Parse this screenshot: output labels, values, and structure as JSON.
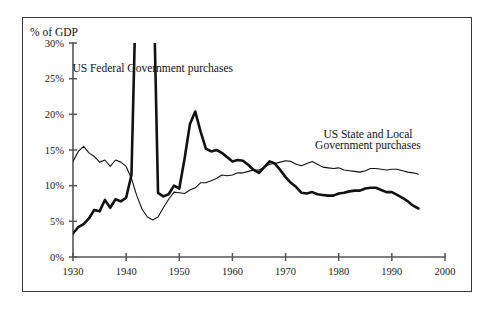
{
  "figure": {
    "y_axis_title": "% of GDP",
    "frame_color": "#3a3a3a",
    "background": "#ffffff"
  },
  "annotations": [
    {
      "name": "federal-series-label",
      "text": "US Federal Government purchases",
      "x": 1945.0,
      "y": 26.0
    },
    {
      "name": "state-local-series-label-line1",
      "text": "US State and Local",
      "x": 1985.5,
      "y": 16.7
    },
    {
      "name": "state-local-series-label-line2",
      "text": "Government purchases",
      "x": 1985.5,
      "y": 15.1
    }
  ],
  "chart_data": {
    "type": "line",
    "title": "",
    "xlabel": "",
    "ylabel": "% of GDP",
    "xlim": [
      1930,
      2000
    ],
    "ylim": [
      0,
      30
    ],
    "grid": false,
    "legend": "inline-annotations",
    "xticks": [
      1930,
      1940,
      1950,
      1960,
      1970,
      1980,
      1990,
      2000
    ],
    "xtick_labels": [
      "1930",
      "1940",
      "1950",
      "1960",
      "1970",
      "1980",
      "1990",
      "2000"
    ],
    "yticks": [
      0,
      5,
      10,
      15,
      20,
      25,
      30
    ],
    "ytick_labels": [
      "0%",
      "5%",
      "10%",
      "15%",
      "20%",
      "25%",
      "30%"
    ],
    "note": "Federal series is clipped at the 30% top of the plot during WWII (1942-1945).",
    "series": [
      {
        "name": "US Federal Government purchases",
        "style": "thick",
        "color": "#111111",
        "x": [
          1930,
          1931,
          1932,
          1933,
          1934,
          1935,
          1936,
          1937,
          1938,
          1939,
          1940,
          1941,
          1941.6,
          1942,
          1943,
          1944,
          1945,
          1945.4,
          1946,
          1947,
          1948,
          1949,
          1950,
          1951,
          1952,
          1953,
          1954,
          1955,
          1956,
          1957,
          1958,
          1959,
          1960,
          1961,
          1962,
          1963,
          1964,
          1965,
          1966,
          1967,
          1968,
          1969,
          1970,
          1971,
          1972,
          1973,
          1974,
          1975,
          1976,
          1977,
          1978,
          1979,
          1980,
          1981,
          1982,
          1983,
          1984,
          1985,
          1986,
          1987,
          1988,
          1989,
          1990,
          1991,
          1992,
          1993,
          1994,
          1995
        ],
        "y": [
          3.3,
          4.2,
          4.6,
          5.4,
          6.6,
          6.4,
          8.0,
          6.9,
          8.1,
          7.8,
          8.3,
          11.5,
          30.0,
          41.0,
          44.0,
          43.0,
          38.0,
          30.0,
          9.0,
          8.5,
          8.8,
          10.0,
          9.6,
          13.8,
          18.6,
          20.4,
          17.6,
          15.2,
          14.8,
          15.0,
          14.6,
          14.0,
          13.4,
          13.6,
          13.5,
          12.9,
          12.2,
          11.8,
          12.6,
          13.4,
          13.1,
          12.2,
          11.2,
          10.4,
          9.8,
          9.0,
          8.9,
          9.1,
          8.8,
          8.7,
          8.6,
          8.6,
          8.9,
          9.0,
          9.2,
          9.3,
          9.3,
          9.6,
          9.7,
          9.7,
          9.4,
          9.1,
          9.1,
          8.7,
          8.3,
          7.8,
          7.2,
          6.8
        ]
      },
      {
        "name": "US State and Local Government purchases",
        "style": "thin",
        "color": "#111111",
        "x": [
          1930,
          1931,
          1932,
          1933,
          1934,
          1935,
          1936,
          1937,
          1938,
          1939,
          1940,
          1941,
          1942,
          1943,
          1944,
          1945,
          1946,
          1947,
          1948,
          1949,
          1950,
          1951,
          1952,
          1953,
          1954,
          1955,
          1956,
          1957,
          1958,
          1959,
          1960,
          1961,
          1962,
          1963,
          1964,
          1965,
          1966,
          1967,
          1968,
          1969,
          1970,
          1971,
          1972,
          1973,
          1974,
          1975,
          1976,
          1977,
          1978,
          1979,
          1980,
          1981,
          1982,
          1983,
          1984,
          1985,
          1986,
          1987,
          1988,
          1989,
          1990,
          1991,
          1992,
          1993,
          1994,
          1995
        ],
        "y": [
          13.4,
          14.8,
          15.5,
          14.6,
          14.1,
          13.3,
          13.6,
          12.7,
          13.6,
          13.3,
          12.7,
          11.0,
          8.6,
          6.7,
          5.6,
          5.2,
          5.6,
          6.9,
          8.1,
          9.1,
          9.0,
          8.9,
          9.4,
          9.7,
          10.4,
          10.4,
          10.7,
          11.0,
          11.5,
          11.4,
          11.5,
          11.8,
          11.8,
          12.0,
          12.2,
          12.2,
          12.6,
          13.0,
          13.1,
          13.3,
          13.5,
          13.4,
          13.0,
          12.8,
          13.1,
          13.4,
          13.0,
          12.6,
          12.5,
          12.4,
          12.5,
          12.2,
          12.1,
          12.0,
          11.9,
          12.1,
          12.4,
          12.4,
          12.3,
          12.2,
          12.3,
          12.3,
          12.1,
          11.9,
          11.8,
          11.6
        ]
      }
    ]
  }
}
